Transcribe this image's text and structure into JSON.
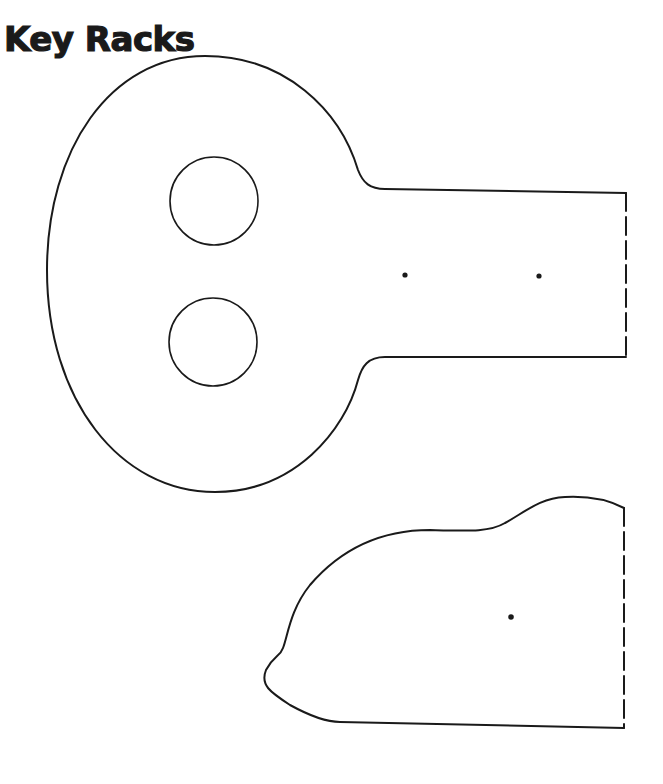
{
  "page": {
    "title": "Key Racks"
  },
  "colors": {
    "ink": "#1a1a1a",
    "paper": "#ffffff"
  },
  "pattern_pieces": [
    {
      "name": "key-rack-body",
      "features": [
        "oval-head",
        "two-circle-cutouts",
        "handle-with-two-nail-holes",
        "dashed-fold-edge"
      ]
    },
    {
      "name": "key-rack-side-piece",
      "features": [
        "curved-profile",
        "one-nail-hole",
        "dashed-fold-edge"
      ]
    }
  ]
}
